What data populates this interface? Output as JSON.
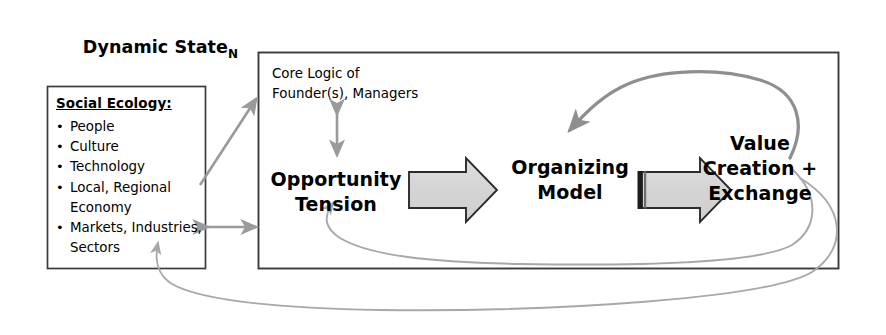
{
  "title": {
    "main": "Dynamic State",
    "subscript": "N"
  },
  "social_ecology": {
    "heading": "Social Ecology:",
    "items": [
      "People",
      "Culture",
      "Technology",
      "Local, Regional\nEconomy",
      "Markets, Industries,\nSectors"
    ]
  },
  "core_logic": {
    "label": "Core Logic of\nFounder(s), Managers"
  },
  "stages": [
    {
      "id": "opportunity-tension",
      "label": "Opportunity\nTension"
    },
    {
      "id": "organizing-model",
      "label": "Organizing\nModel"
    },
    {
      "id": "value-creation",
      "label": "Value\nCreation\n+\nExchange"
    }
  ],
  "colors": {
    "box_stroke": "#3b3b3b",
    "text": "#000000",
    "block_arrow_fill": "#d9d9d9",
    "block_arrow_stroke": "#2b2b2b",
    "block_arrow_tail": "#1c1c1c",
    "gray_arrow": "#9a9a9a",
    "feedback_dark": "#8c8c8c",
    "feedback_light": "#b5b5b5",
    "background": "#ffffff"
  },
  "connectors": [
    {
      "name": "social-ecology-to-core-logic",
      "style": "diagonal-arrow",
      "direction": "one-way"
    },
    {
      "name": "core-logic-to-opportunity-tension",
      "style": "vertical-arrow",
      "direction": "two-way"
    },
    {
      "name": "social-ecology-to-dynamic-state",
      "style": "horizontal-arrow",
      "direction": "two-way"
    },
    {
      "name": "opportunity-tension-to-organizing-model",
      "style": "block-arrow",
      "direction": "one-way"
    },
    {
      "name": "organizing-model-to-value-creation",
      "style": "block-arrow-with-tail-bar",
      "direction": "one-way"
    },
    {
      "name": "value-creation-to-organizing-model-feedback",
      "style": "curved-loop-top",
      "direction": "one-way"
    },
    {
      "name": "value-creation-to-opportunity-tension-feedback",
      "style": "curved-loop-bottom-inner",
      "direction": "one-way"
    },
    {
      "name": "value-creation-to-social-ecology-feedback",
      "style": "curved-loop-bottom-outer",
      "direction": "one-way"
    }
  ]
}
